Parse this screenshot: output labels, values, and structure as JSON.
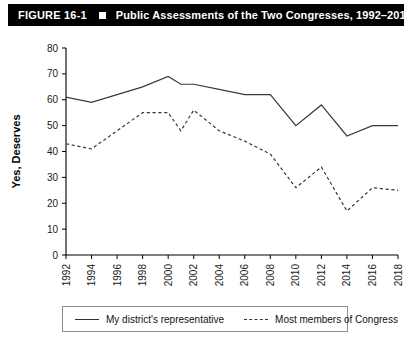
{
  "header": {
    "figure_number": "FIGURE 16-1",
    "bullet_icon": "square-bullet-icon",
    "title": "Public Assessments of the Two Congresses, 1992–2018"
  },
  "legend": {
    "items": [
      {
        "label": "My district's representative",
        "style": "solid"
      },
      {
        "label": "Most members of Congress",
        "style": "dashed"
      }
    ]
  },
  "chart_data": {
    "type": "line",
    "title": "Public Assessments of the Two Congresses, 1992–2018",
    "xlabel": "",
    "ylabel": "Yes, Deserves",
    "xlim": [
      1992,
      2018
    ],
    "ylim": [
      0,
      80
    ],
    "ytick_step": 10,
    "yticks": [
      0,
      10,
      20,
      30,
      40,
      50,
      60,
      70,
      80
    ],
    "categories": [
      1992,
      1993,
      1994,
      1995,
      1996,
      1997,
      1998,
      1999,
      2000,
      2001,
      2002,
      2003,
      2004,
      2005,
      2006,
      2007,
      2008,
      2009,
      2010,
      2011,
      2012,
      2013,
      2014,
      2015,
      2016,
      2017,
      2018
    ],
    "xticks": [
      1992,
      1994,
      1996,
      1998,
      2000,
      2002,
      2004,
      2006,
      2008,
      2010,
      2012,
      2014,
      2016,
      2018
    ],
    "xtick_labels": [
      "1992",
      "1994",
      "1996",
      "1998",
      "2000",
      "2002",
      "2004",
      "2006",
      "2008",
      "2010",
      "2012",
      "2014",
      "2016",
      "2018"
    ],
    "grid": false,
    "legend_position": "bottom",
    "series": [
      {
        "name": "My district's representative",
        "style": "solid",
        "x": [
          1992,
          1994,
          1996,
          1998,
          2000,
          2001,
          2002,
          2004,
          2006,
          2008,
          2010,
          2012,
          2014,
          2016,
          2018
        ],
        "values": [
          61,
          59,
          62,
          65,
          69,
          66,
          66,
          64,
          62,
          62,
          50,
          58,
          46,
          50,
          50
        ]
      },
      {
        "name": "Most members of Congress",
        "style": "dashed",
        "x": [
          1992,
          1994,
          1996,
          1998,
          2000,
          2001,
          2002,
          2004,
          2006,
          2008,
          2010,
          2012,
          2014,
          2016,
          2018
        ],
        "values": [
          43,
          41,
          48,
          55,
          55,
          48,
          56,
          48,
          44,
          39,
          26,
          34,
          17,
          26,
          25
        ]
      }
    ]
  }
}
